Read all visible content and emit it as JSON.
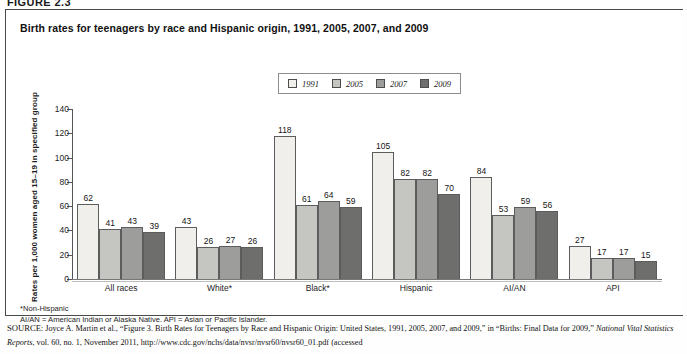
{
  "figure": {
    "number_label": "FIGURE 2.3",
    "title": "Birth rates for teenagers by race and Hispanic origin, 1991, 2005, 2007, and 2009"
  },
  "legend": {
    "items": [
      {
        "label": "1991",
        "color": "#f0efeb"
      },
      {
        "label": "2005",
        "color": "#c5c5c2"
      },
      {
        "label": "2007",
        "color": "#9d9d9c"
      },
      {
        "label": "2009",
        "color": "#6e6e6d"
      }
    ]
  },
  "axes": {
    "ylabel": "Rates per 1,000 women aged 15–19 in specified group",
    "yticks": [
      0,
      20,
      40,
      60,
      80,
      100,
      120,
      140
    ]
  },
  "notes": {
    "line1": "*Non-Hispanic",
    "line2": "AI/AN = American Indian or Alaska Native. API = Asian or Pacific Islander."
  },
  "source": {
    "prefix": "SOURCE",
    "text_a": ": Joyce A. Martin et al., “Figure 3. Birth Rates for Teenagers by Race and Hispanic Origin: United States, 1991, 2005, 2007, and 2009,” in “Births: Final Data for 2009,” ",
    "italic": "National Vital Statistics Reports",
    "text_b": ", vol. 60, no. 1, November 2011, http://www.cdc.gov/nchs/data/nvsr/nvsr60/nvsr60_01.pdf (accessed"
  },
  "chart_data": {
    "type": "bar",
    "title": "Birth rates for teenagers by race and Hispanic origin, 1991, 2005, 2007, and 2009",
    "xlabel": "",
    "ylabel": "Rates per 1,000 women aged 15–19 in specified group",
    "ylim": [
      0,
      140
    ],
    "ytick_step": 20,
    "grid": false,
    "legend_position": "top-center",
    "categories": [
      "All races",
      "White*",
      "Black*",
      "Hispanic",
      "AI/AN",
      "API"
    ],
    "series": [
      {
        "name": "1991",
        "color": "#f0efeb",
        "values": [
          62,
          43,
          118,
          105,
          84,
          27
        ]
      },
      {
        "name": "2005",
        "color": "#c5c5c2",
        "values": [
          41,
          26,
          61,
          82,
          53,
          17
        ]
      },
      {
        "name": "2007",
        "color": "#9d9d9c",
        "values": [
          43,
          27,
          64,
          82,
          59,
          17
        ]
      },
      {
        "name": "2009",
        "color": "#6e6e6d",
        "values": [
          39,
          26,
          59,
          70,
          56,
          15
        ]
      }
    ]
  }
}
